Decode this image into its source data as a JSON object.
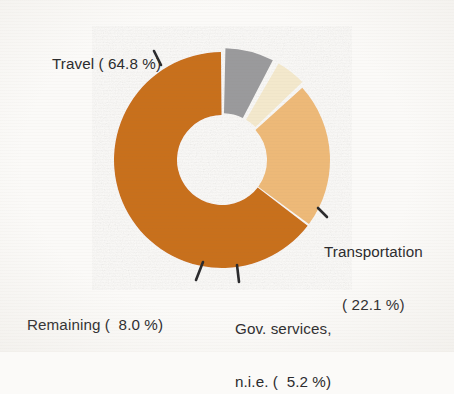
{
  "chart_data": {
    "type": "pie",
    "variant": "donut",
    "title": "",
    "subtitle": "",
    "xlabel": "",
    "ylabel": "",
    "grid": false,
    "legend_position": "none",
    "labels_inline": true,
    "total_percent": "100.1",
    "categories": [
      "Travel",
      "Transportation",
      "Gov. services, n.i.e.",
      "Remaining"
    ],
    "values": [
      64.8,
      22.1,
      5.2,
      8.0
    ],
    "colors": [
      "#c8701c",
      "#edb978",
      "#f3e8cc",
      "#9a9a9c"
    ],
    "slices": [
      {
        "name": "Travel",
        "value": 64.8,
        "value_text": "64.8",
        "label_text": "Travel ( 64.8 %)",
        "color": "#c8701c",
        "exploded": false,
        "leader": "tick-down-left"
      },
      {
        "name": "Transportation",
        "value": 22.1,
        "value_text": "22.1",
        "label_line_1": "Transportation",
        "label_line_2": "( 22.1 %)",
        "color": "#edb978",
        "exploded": false,
        "leader": "tick-down-left"
      },
      {
        "name": "Gov. services, n.i.e.",
        "value": 5.2,
        "value_text": "5.2",
        "label_line_1": "Gov. services,",
        "label_line_2": "n.i.e. (  5.2 %)",
        "color": "#f3e8cc",
        "exploded": true,
        "leader": "tick-vertical"
      },
      {
        "name": "Remaining",
        "value": 8.0,
        "value_text": "8.0",
        "label_text": "Remaining (  8.0 %)",
        "color": "#9a9a9c",
        "exploded": true,
        "leader": "tick-up-right"
      }
    ]
  },
  "colors": {
    "background": "#fbfaf8",
    "text": "#2b2b2d",
    "travel": "#c8701c",
    "transportation": "#edb978",
    "gov_services": "#f3e8cc",
    "remaining": "#9a9a9c",
    "hole": "#fbfaf8"
  }
}
